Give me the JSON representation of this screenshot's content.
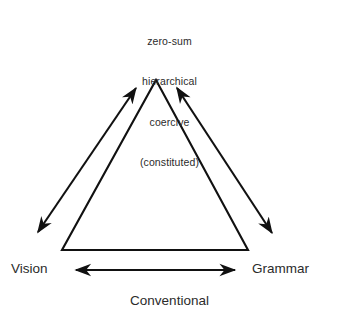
{
  "diagram": {
    "type": "triangle-relationship-diagram",
    "background_color": "#ffffff",
    "stroke_color": "#111111",
    "text_color": "#2b2b2b",
    "apex_label": {
      "lines": [
        "zero-sum",
        "hierarchical",
        "coercive",
        "(constituted)"
      ],
      "line1": "zero-sum",
      "line2": "hierarchical",
      "line3": "coercive",
      "line4": "(constituted)"
    },
    "vertices": {
      "left_label": "Vision",
      "right_label": "Grammar",
      "bottom_caption": "Conventional"
    },
    "arrows": [
      {
        "name": "left-diagonal-double-arrow",
        "double_headed": true,
        "from": "lower-left",
        "to": "apex"
      },
      {
        "name": "right-diagonal-double-arrow",
        "double_headed": true,
        "from": "apex",
        "to": "lower-right"
      },
      {
        "name": "bottom-horizontal-double-arrow",
        "double_headed": true,
        "from": "Vision",
        "to": "Grammar"
      }
    ]
  }
}
